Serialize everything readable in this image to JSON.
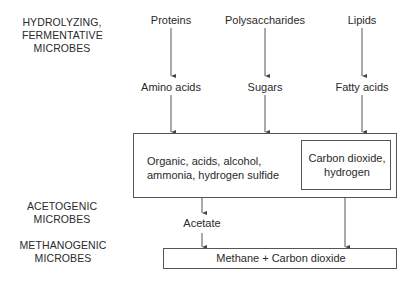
{
  "stages": {
    "hydrolyzing": "HYDROLYZING,\nFERMENTATIVE\nMICROBES",
    "acetogenic": "ACETOGENIC\nMICROBES",
    "methanogenic": "METHANOGENIC\nMICROBES"
  },
  "substrates": {
    "proteins": "Proteins",
    "polysaccharides": "Polysaccharides",
    "lipids": "Lipids"
  },
  "monomers": {
    "amino_acids": "Amino acids",
    "sugars": "Sugars",
    "fatty_acids": "Fatty acids"
  },
  "intermediates": {
    "organics": "Organic, acids, alcohol,\nammonia, hydrogen sulfide",
    "co2_h2": "Carbon dioxide,\nhydrogen"
  },
  "acetate": "Acetate",
  "products": "Methane + Carbon dioxide"
}
